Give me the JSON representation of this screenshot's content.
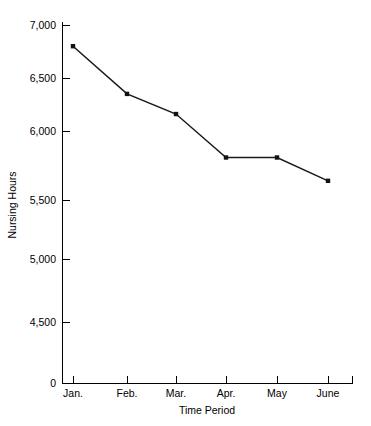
{
  "chart_data": {
    "type": "line",
    "title": "",
    "xlabel": "Time Period",
    "ylabel": "Nursing Hours",
    "categories": [
      "Jan.",
      "Feb.",
      "Mar.",
      "Apr.",
      "May",
      "June"
    ],
    "values": [
      6800,
      6350,
      6160,
      5750,
      5750,
      5530
    ],
    "series": [
      {
        "name": "Nursing Hours",
        "values": [
          6800,
          6350,
          6160,
          5750,
          5750,
          5530
        ]
      }
    ],
    "ytick_labels": [
      "7,000",
      "6,500",
      "6,000",
      "5,500",
      "5,000",
      "4,500",
      "0"
    ],
    "ytick_values": [
      7000,
      6500,
      6000,
      5500,
      5000,
      4500,
      0
    ],
    "ylim": [
      0,
      7000
    ],
    "y_axis_break": true,
    "grid": false,
    "legend": false,
    "marker": "square",
    "line_color": "#1a1a1a",
    "marker_color": "#111111",
    "background": "#ffffff"
  },
  "axis": {
    "y_title": "Nursing Hours",
    "x_title": "Time Period"
  }
}
